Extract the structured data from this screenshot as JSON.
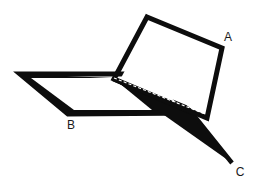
{
  "figure": {
    "background_color": "#ffffff",
    "ink_color": "#0d0d0d",
    "hidden_edge_color": "#ffffff",
    "hidden_edge_style": "dashed",
    "labels": [
      {
        "text": "A",
        "x": 228,
        "y": 38,
        "name": "vertex-label-a"
      },
      {
        "text": "B",
        "x": 71,
        "y": 126,
        "name": "vertex-label-b"
      },
      {
        "text": "C",
        "x": 240,
        "y": 173,
        "name": "vertex-label-c"
      }
    ],
    "shapes": {
      "upper_panel_outer": "147,17 222,48 207,118 114,79",
      "upper_panel_inner": "150,23 216,50 203,112 121,78",
      "lower_plane_outer": "20,74 148,74 192,113 68,114",
      "lower_plane_inner": "31,78 140,78 181,109 74,110",
      "black_band": "113,78 192,113 68,114 20,74",
      "white_inner_parallelogram": "31,78 113,78 152,110 74,110",
      "lower_right_wedge": "113,79 192,113 232,163",
      "wedge_fill": "113,79 232,163 192,113",
      "wedge_lower_edge": "232,163 192,113",
      "hidden_diagonal_start_x": 114,
      "hidden_diagonal_start_y": 78,
      "hidden_diagonal_end_x": 205,
      "hidden_diagonal_end_y": 114
    },
    "stroke_widths": {
      "panel": 5.0,
      "plane": 5.0,
      "wedge": 4.5
    }
  }
}
